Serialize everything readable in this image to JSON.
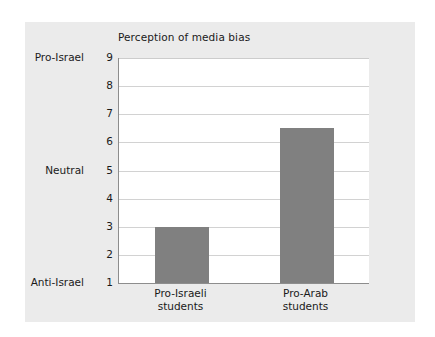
{
  "chart_data": {
    "type": "bar",
    "title": "Perception of media bias",
    "xlabel": "",
    "ylabel": "",
    "categories": [
      "Pro-Israeli students",
      "Pro-Arab students"
    ],
    "category_lines": [
      [
        "Pro-Israeli",
        "students"
      ],
      [
        "Pro-Arab",
        "students"
      ]
    ],
    "values": [
      3,
      6.5
    ],
    "ylim": [
      1,
      9
    ],
    "yticks": [
      1,
      2,
      3,
      4,
      5,
      6,
      7,
      8,
      9
    ],
    "ytick_labels": [
      "1",
      "2",
      "3",
      "4",
      "5",
      "6",
      "7",
      "8",
      "9"
    ],
    "y_category_labels": [
      {
        "value": 9,
        "label": "Pro-Israel"
      },
      {
        "value": 5,
        "label": "Neutral"
      },
      {
        "value": 1,
        "label": "Anti-Israel"
      }
    ],
    "grid": true,
    "legend": false,
    "colors": {
      "bar": "#808080",
      "plot_background": "#ffffff",
      "card_background": "#ebebeb",
      "gridline": "#d2d2d2",
      "axis": "#8d8d8d",
      "text": "#1a1a1a"
    }
  }
}
